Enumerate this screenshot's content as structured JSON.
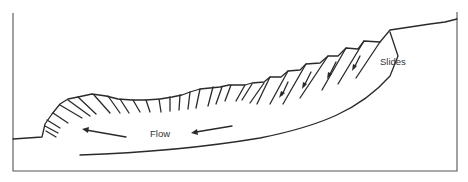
{
  "diagram": {
    "labels": {
      "slides": "Slides",
      "flow": "Flow"
    },
    "colors": {
      "line": "#2a2a2a",
      "frame": "#555555",
      "background": "#ffffff"
    }
  }
}
